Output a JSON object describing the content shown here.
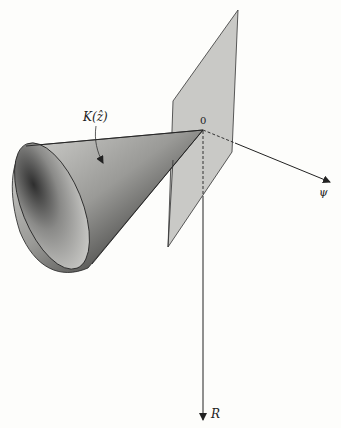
{
  "figure": {
    "cone_label": "K(ẑ)",
    "origin_label": "0",
    "axis_psi_label": "ψ",
    "axis_r_label": "R"
  },
  "colors": {
    "background": "#fdfdfb",
    "plane_fill": "#c9c9c6",
    "line": "#222222",
    "cone_light": "#d8d8d5",
    "cone_dark": "#2a2a2a"
  }
}
